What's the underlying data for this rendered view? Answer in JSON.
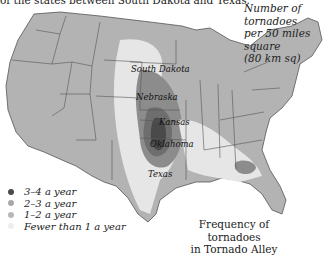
{
  "caption_top": "of the states between South Dakota and Texas.",
  "unit_note": {
    "line1": "Number of tornadoes",
    "line2": "per 50 miles square",
    "line3": "(80 km sq)"
  },
  "title": {
    "line1": "Frequency of tornadoes",
    "line2": "in Tornado Alley"
  },
  "state_labels": {
    "south_dakota": "South Dakota",
    "nebraska": "Nebraska",
    "kansas": "Kansas",
    "oklahoma": "Oklahoma",
    "texas": "Texas"
  },
  "legend": [
    {
      "label": "3–4 a year",
      "color": "#4a4a4a"
    },
    {
      "label": "2–3 a year",
      "color": "#8c8c8c"
    },
    {
      "label": "1–2 a year",
      "color": "#b3b3b3"
    },
    {
      "label": "Fewer than 1 a year",
      "color": "#e6e6e6"
    }
  ],
  "colors": {
    "base_land": "#b3b3b3",
    "low": "#e6e6e6",
    "mid": "#8c8c8c",
    "high": "#4a4a4a",
    "border": "#555555",
    "water": "#ffffff"
  }
}
